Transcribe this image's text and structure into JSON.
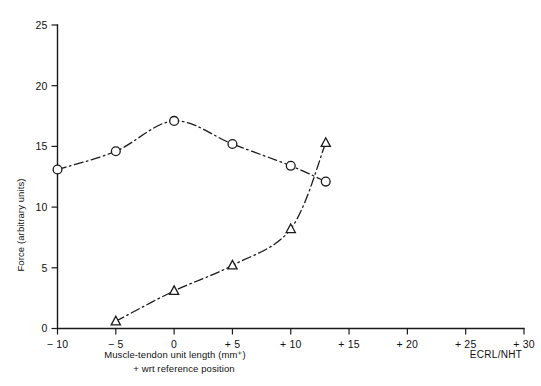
{
  "chart_data": {
    "type": "line",
    "title": "",
    "xlabel": "Muscle-tendon unit length (mm⁺)",
    "xlabel_note": "+ wrt reference position",
    "ylabel": "Force (arbitrary units)",
    "corner_annotation": "ECRL/NHT",
    "xlim": [
      -10,
      30
    ],
    "ylim": [
      0,
      25
    ],
    "xticks": [
      -10,
      -5,
      0,
      5,
      10,
      15,
      20,
      25,
      30
    ],
    "xtick_labels": [
      "− 10",
      "− 5",
      "0",
      "+ 5",
      "+ 10",
      "+ 15",
      "+ 20",
      "+ 25",
      "+ 30"
    ],
    "yticks": [
      0,
      5,
      10,
      15,
      20,
      25
    ],
    "ytick_labels": [
      "0",
      "5",
      "10",
      "15",
      "20",
      "25"
    ],
    "grid": false,
    "legend": "none",
    "line_style": "dash-dot",
    "line_color": "#1a1a1a",
    "background_color": "#ffffff",
    "series": [
      {
        "name": "circle-series",
        "marker": "circle",
        "x": [
          -10,
          -5,
          0,
          5,
          10,
          13
        ],
        "values": [
          13.1,
          14.6,
          17.1,
          15.2,
          13.4,
          12.1
        ]
      },
      {
        "name": "triangle-series",
        "marker": "triangle",
        "x": [
          -5,
          0,
          5,
          10,
          13
        ],
        "values": [
          0.6,
          3.1,
          5.2,
          8.2,
          15.3
        ]
      }
    ]
  }
}
